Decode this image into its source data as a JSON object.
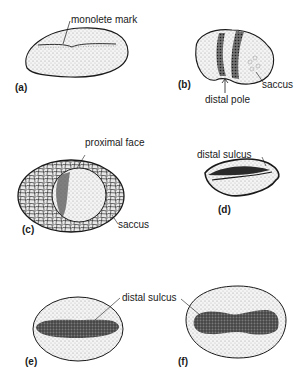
{
  "diagram": {
    "type": "labeled illustration",
    "panels": [
      {
        "id": "a",
        "label": "(a)",
        "annotations": [
          "monolete mark"
        ]
      },
      {
        "id": "b",
        "label": "(b)",
        "annotations": [
          "distal pole",
          "saccus"
        ]
      },
      {
        "id": "c",
        "label": "(c)",
        "annotations": [
          "proximal face",
          "saccus"
        ]
      },
      {
        "id": "d",
        "label": "(d)",
        "annotations": [
          "distal sulcus"
        ]
      },
      {
        "id": "e",
        "label": "(e)",
        "annotations": []
      },
      {
        "id": "f",
        "label": "(f)",
        "annotations": []
      }
    ],
    "shared_annotation": "distal sulcus"
  },
  "colors": {
    "ink": "#1a1a1a",
    "stipple": "#bdbdbd",
    "dark_fill": "#4a4a4a",
    "background": "#ffffff"
  }
}
